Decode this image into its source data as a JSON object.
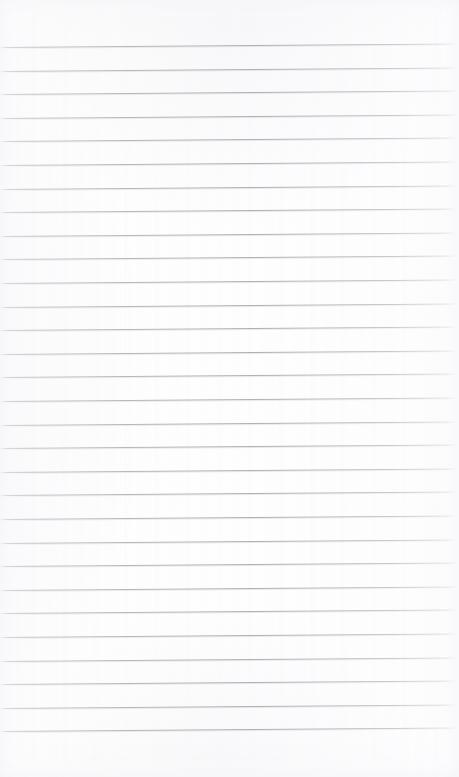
{
  "page": {
    "kind": "ruled-notebook-page",
    "width": 459,
    "height": 777,
    "background_color": "#fdfdfd",
    "text_content": "",
    "has_text": false,
    "has_margin_rule": false
  },
  "ruling": {
    "line_color": "#acaeb5",
    "line_color_faded": "#c8c9cd",
    "line_thickness": 1,
    "line_count": 29,
    "line_spacing": 23.6,
    "first_line_y": 47,
    "last_line_y": 731,
    "tilt_degrees": -0.45,
    "left_inset": 0,
    "right_inset": 0,
    "top_margin": 47,
    "bottom_margin": 46,
    "lines_y": [
      47.0,
      70.6,
      94.2,
      117.8,
      141.4,
      165.0,
      188.6,
      212.2,
      235.8,
      259.4,
      283.0,
      306.6,
      330.2,
      353.8,
      377.4,
      401.0,
      424.6,
      448.2,
      471.8,
      495.4,
      519.0,
      542.6,
      566.2,
      589.8,
      613.4,
      637.0,
      660.6,
      684.2,
      707.8,
      731.4
    ]
  }
}
